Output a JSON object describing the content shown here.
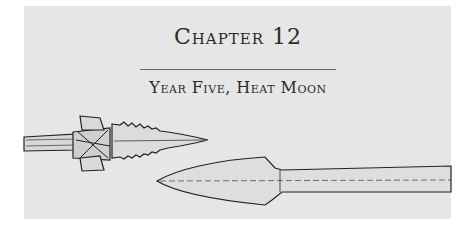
{
  "chapter": {
    "title": "Chapter 12",
    "subtitle": "Year Five, Heat Moon"
  },
  "illustration": {
    "items": [
      "serrated-spear-point",
      "leaf-shaped-spear-point"
    ]
  },
  "colors": {
    "panel": "#e6e6e6",
    "ink": "#2a2a2a"
  }
}
